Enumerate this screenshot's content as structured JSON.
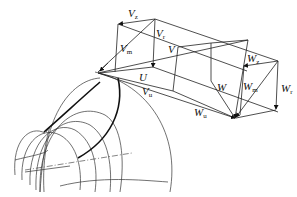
{
  "diagram": {
    "type": "velocity-triangle-3d",
    "labels": {
      "Vz": {
        "main": "V",
        "sub": "z"
      },
      "Vr": {
        "main": "V",
        "sub": "r"
      },
      "Vm": {
        "main": "V",
        "sub": "m"
      },
      "V": {
        "main": "V",
        "sub": ""
      },
      "U": {
        "main": "U",
        "sub": ""
      },
      "Vu": {
        "main": "V",
        "sub": "u"
      },
      "Wz": {
        "main": "W",
        "sub": "z"
      },
      "Wm": {
        "main": "W",
        "sub": "m"
      },
      "Wr": {
        "main": "W",
        "sub": "r"
      },
      "W": {
        "main": "W",
        "sub": ""
      },
      "Wu": {
        "main": "W",
        "sub": "u"
      }
    },
    "stroke_color": "#222222",
    "background": "#ffffff"
  }
}
